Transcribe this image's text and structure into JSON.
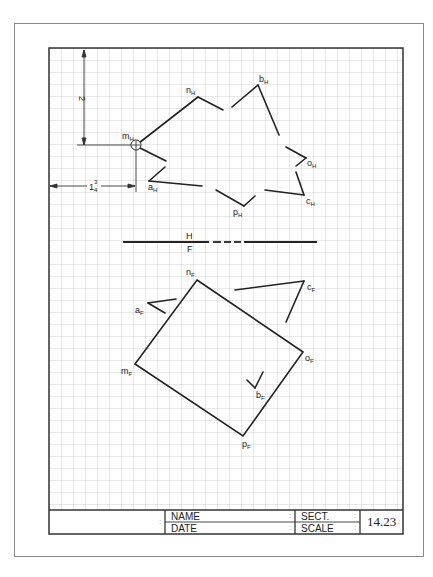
{
  "sheet": {
    "problem_number": "14.23",
    "grid_cell_px": 12
  },
  "dimensions": {
    "vertical": {
      "label": "2"
    },
    "horizontal": {
      "label_whole": "1",
      "label_num": "3",
      "label_den": "4"
    }
  },
  "folding_line": {
    "upper_label": "H",
    "lower_label": "F"
  },
  "top_view": {
    "points": [
      {
        "name": "m",
        "sub": "H"
      },
      {
        "name": "n",
        "sub": "H"
      },
      {
        "name": "b",
        "sub": "H"
      },
      {
        "name": "o",
        "sub": "H"
      },
      {
        "name": "c",
        "sub": "H"
      },
      {
        "name": "p",
        "sub": "H"
      },
      {
        "name": "a",
        "sub": "H"
      }
    ]
  },
  "front_view": {
    "points": [
      {
        "name": "n",
        "sub": "F"
      },
      {
        "name": "c",
        "sub": "F"
      },
      {
        "name": "a",
        "sub": "F"
      },
      {
        "name": "o",
        "sub": "F"
      },
      {
        "name": "m",
        "sub": "F"
      },
      {
        "name": "b",
        "sub": "F"
      },
      {
        "name": "p",
        "sub": "F"
      }
    ]
  },
  "title_block": {
    "name_label": "NAME",
    "date_label": "DATE",
    "sect_label": "SECT.",
    "scale_label": "SCALE",
    "colon": ":",
    "number": "14.23"
  },
  "colors": {
    "line": "#222222",
    "grid": "#bdbdbd",
    "frame": "#333333",
    "border": "#8a8a8a"
  }
}
